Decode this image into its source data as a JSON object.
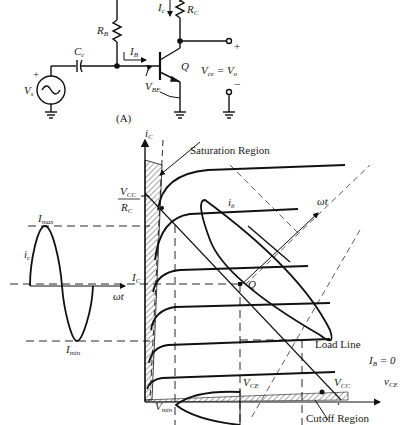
{
  "circuit": {
    "label": "(A)",
    "resistor_base": "R",
    "resistor_base_sub": "B",
    "resistor_collector": "R",
    "resistor_collector_sub": "C",
    "capacitor": "C",
    "capacitor_sub": "c",
    "source": "V",
    "source_sub": "s",
    "base_current": "I",
    "base_current_sub": "B",
    "collector_current": "I",
    "collector_current_sub": "c",
    "vbe": "V",
    "vbe_sub": "BE",
    "transistor": "Q",
    "output_eq": "V",
    "output_eq_sub1": "ce",
    "output_eq_mid": " = V",
    "output_eq_sub2": "o",
    "plus": "+",
    "minus": "−"
  },
  "graph": {
    "y_axis": "i",
    "y_axis_sub": "C",
    "x_axis": "v",
    "x_axis_sub": "CE",
    "saturation_region": "Saturation Region",
    "cutoff_region": "Cutoff Region",
    "load_line": "Load Line",
    "vcc_over_rc_num": "V",
    "vcc_over_rc_num_sub": "CC",
    "vcc_over_rc_den": "R",
    "vcc_over_rc_den_sub": "C",
    "ib_curve": "i",
    "ib_curve_sub": "b",
    "omega_t_diag": "ωt",
    "q_point": "Q",
    "ic_level": "I",
    "ic_level_sub": "C",
    "vce_tick": "V",
    "vce_tick_sub": "CE",
    "vcc_tick": "V",
    "vcc_tick_sub": "CC",
    "ib_zero": "I",
    "ib_zero_sub": "B",
    "ib_zero_val": " = 0",
    "vce_bottom": "V",
    "vce_bottom_sub": "CE",
    "vmin": "V",
    "vmin_sub": "min"
  },
  "waveform": {
    "imax": "I",
    "imax_sub": "max",
    "imin": "I",
    "imin_sub": "min",
    "ic": "i",
    "ic_sub": "c",
    "omega_t": "ωt"
  }
}
